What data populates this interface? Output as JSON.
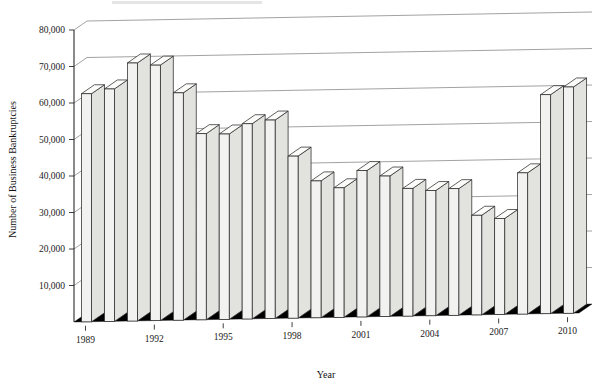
{
  "chart_data": {
    "type": "bar",
    "title": "",
    "subtitle": "",
    "xlabel": "Year",
    "ylabel": "Number of Business Bankruptcies",
    "ylim": [
      0,
      80000
    ],
    "ytick_values": [
      10000,
      20000,
      30000,
      40000,
      50000,
      60000,
      70000,
      80000
    ],
    "ytick_labels": [
      "10,000",
      "20,000",
      "30,000",
      "40,000",
      "50,000",
      "60,000",
      "70,000",
      "80,000"
    ],
    "xtick_labels": [
      "1989",
      "1992",
      "1995",
      "1998",
      "2001",
      "2004",
      "2007",
      "2010"
    ],
    "grid": true,
    "legend": false,
    "legend_position": "none",
    "style": "3d-column",
    "categories": [
      "1989",
      "1990",
      "1991",
      "1992",
      "1993",
      "1994",
      "1995",
      "1996",
      "1997",
      "1998",
      "1999",
      "2000",
      "2001",
      "2002",
      "2003",
      "2004",
      "2005",
      "2006",
      "2007",
      "2008",
      "2009",
      "2010"
    ],
    "values": [
      62500,
      63700,
      70700,
      70000,
      62300,
      51000,
      50800,
      53500,
      54400,
      44400,
      37500,
      35500,
      40100,
      38500,
      35000,
      34300,
      34700,
      27300,
      26300,
      38700,
      60000,
      62000
    ]
  },
  "axes": {
    "y_title": "Number of Business Bankruptcies",
    "x_title": "Year"
  }
}
